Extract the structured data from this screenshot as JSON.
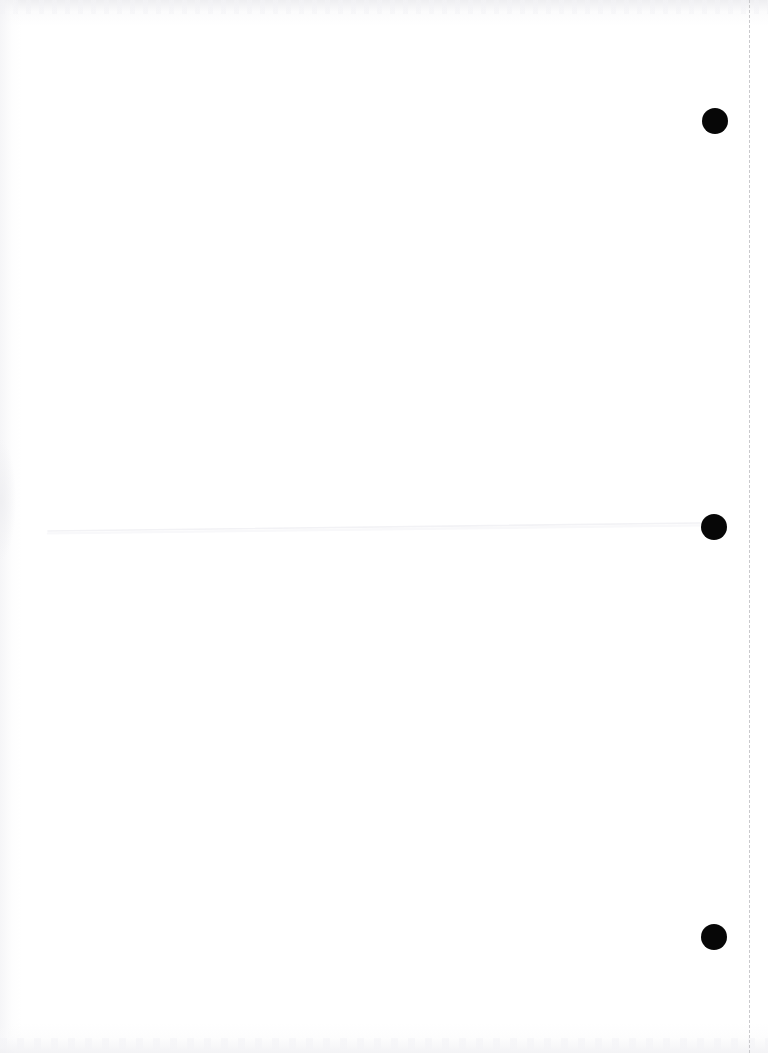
{
  "document": {
    "kind": "scanned-page",
    "page_label": "",
    "width_px": 768,
    "height_px": 1053,
    "background_color": "#ffffff",
    "body_text": ""
  },
  "marks": {
    "registration_dots": [
      {
        "id": "registration-dot-top",
        "cx": 715,
        "cy": 121,
        "diameter": 26,
        "color": "#070707"
      },
      {
        "id": "registration-dot-middle",
        "cx": 714,
        "cy": 527,
        "diameter": 26,
        "color": "#070707"
      },
      {
        "id": "registration-dot-bottom",
        "cx": 714,
        "cy": 937,
        "diameter": 26,
        "color": "#070707"
      }
    ],
    "horizontal_rule": {
      "id": "faint-horizontal-rule",
      "x_start": 48,
      "y_start": 531,
      "x_end": 700,
      "y_end": 523,
      "color": "#f2f2f5",
      "stroke_width": 1.6
    },
    "margin_dashed_line": {
      "id": "dashed-margin-line",
      "x": 749,
      "y_start": 0,
      "y_end": 1053,
      "color": "#c9c9cc",
      "dash": "4 7",
      "stroke_width": 1
    }
  },
  "icons": {
    "dot": "filled-circle-mark",
    "rule": "horizontal-rule",
    "dash": "dashed-vertical-line"
  }
}
